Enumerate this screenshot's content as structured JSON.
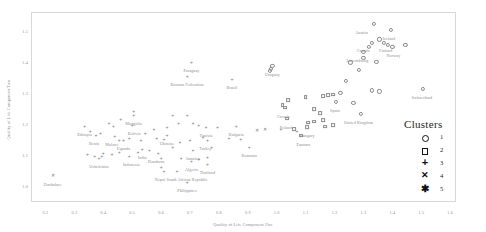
{
  "chart_data": {
    "type": "scatter",
    "title": "",
    "xlabel": "Quality of Life Component One",
    "ylabel": "Quality of Life Component Two",
    "xlim": [
      0.15,
      1.62
    ],
    "ylim": [
      0.95,
      1.56
    ],
    "xticks": [
      "0.2",
      "0.3",
      "0.4",
      "0.5",
      "0.6",
      "0.7",
      "0.8",
      "0.9",
      "1.0",
      "1.1",
      "1.2",
      "1.3",
      "1.4",
      "1.5",
      "1.6"
    ],
    "xtick_values": [
      0.2,
      0.3,
      0.4,
      0.5,
      0.6,
      0.7,
      0.8,
      0.9,
      1.0,
      1.1,
      1.2,
      1.3,
      1.4,
      1.5,
      1.6
    ],
    "yticks": [
      "1.5",
      "1.4",
      "1.3",
      "1.2",
      "1.1",
      "1.0"
    ],
    "ytick_values": [
      1.5,
      1.4,
      1.3,
      1.2,
      1.1,
      1.0
    ],
    "grid": false,
    "legend_position": "lower-right",
    "legend_title": "Clusters",
    "legend_entries": [
      {
        "label": "1",
        "marker": "circle"
      },
      {
        "label": "2",
        "marker": "square"
      },
      {
        "label": "3",
        "marker": "plus"
      },
      {
        "label": "4",
        "marker": "x"
      },
      {
        "label": "5",
        "marker": "asterisk"
      }
    ],
    "series": [
      {
        "name": "1",
        "marker": "circle"
      },
      {
        "name": "2",
        "marker": "square"
      },
      {
        "name": "3",
        "marker": "plus"
      },
      {
        "name": "4",
        "marker": "x"
      },
      {
        "name": "5",
        "marker": "asterisk"
      }
    ],
    "points": [
      {
        "label": "Austria",
        "x": 1.335,
        "y": 1.523,
        "cluster": 1,
        "lab_dx": -12,
        "lab_dy": 6
      },
      {
        "label": "Iceland",
        "x": 1.395,
        "y": 1.503,
        "cluster": 1,
        "lab_dx": -2,
        "lab_dy": 6
      },
      {
        "label": "Canada",
        "x": 1.33,
        "y": 1.462,
        "cluster": 1,
        "lab_dx": -9,
        "lab_dy": 5
      },
      {
        "label": "Finland",
        "x": 1.37,
        "y": 1.462,
        "cluster": 1,
        "lab_dx": 2,
        "lab_dy": 5
      },
      {
        "label": "Norway",
        "x": 1.4,
        "y": 1.448,
        "cluster": 1,
        "lab_dx": 1,
        "lab_dy": 6
      },
      {
        "label": "Luxembourg",
        "x": 1.3,
        "y": 1.432,
        "cluster": 1,
        "lab_dx": -6,
        "lab_dy": 6
      },
      {
        "label": "Switzerland",
        "x": 1.505,
        "y": 1.313,
        "cluster": 1,
        "lab_dx": -1,
        "lab_dy": 6
      },
      {
        "label": "Spain",
        "x": 1.205,
        "y": 1.272,
        "cluster": 1,
        "lab_dx": -1,
        "lab_dy": 6
      },
      {
        "label": "United Kingdom",
        "x": 1.29,
        "y": 1.233,
        "cluster": 1,
        "lab_dx": -2,
        "lab_dy": 6
      },
      {
        "label": "Uruguay",
        "x": 0.985,
        "y": 1.387,
        "cluster": 1,
        "lab_dx": 0,
        "lab_dy": 6
      },
      {
        "label": "Croatia",
        "x": 1.03,
        "y": 1.253,
        "cluster": 2,
        "lab_dx": -2,
        "lab_dy": 6
      },
      {
        "label": "Poland",
        "x": 1.035,
        "y": 1.218,
        "cluster": 2,
        "lab_dx": -1,
        "lab_dy": 6
      },
      {
        "label": "Hungary",
        "x": 1.105,
        "y": 1.19,
        "cluster": 2,
        "lab_dx": 0,
        "lab_dy": 6
      },
      {
        "label": "Panama",
        "x": 1.085,
        "y": 1.163,
        "cluster": 2,
        "lab_dx": 2,
        "lab_dy": 6
      },
      {
        "label": "Paraguay",
        "x": 0.705,
        "y": 1.4,
        "cluster": 3,
        "lab_dx": 0,
        "lab_dy": 6
      },
      {
        "label": "Russian Federation",
        "x": 0.69,
        "y": 1.355,
        "cluster": 3,
        "lab_dx": 0,
        "lab_dy": 6
      },
      {
        "label": "Brazil",
        "x": 0.845,
        "y": 1.345,
        "cluster": 3,
        "lab_dx": 0,
        "lab_dy": 6
      },
      {
        "label": "Mongolia",
        "x": 0.505,
        "y": 1.228,
        "cluster": 3,
        "lab_dx": 0,
        "lab_dy": 6
      },
      {
        "label": "Bolivia",
        "x": 0.5,
        "y": 1.198,
        "cluster": 3,
        "lab_dx": 2,
        "lab_dy": 6
      },
      {
        "label": "Ethiopia",
        "x": 0.335,
        "y": 1.193,
        "cluster": 3,
        "lab_dx": 0,
        "lab_dy": 6
      },
      {
        "label": "Benin",
        "x": 0.375,
        "y": 1.165,
        "cluster": 3,
        "lab_dx": -2,
        "lab_dy": 6
      },
      {
        "label": "Malawi",
        "x": 0.44,
        "y": 1.162,
        "cluster": 3,
        "lab_dx": -3,
        "lab_dy": 6
      },
      {
        "label": "Uganda",
        "x": 0.47,
        "y": 1.15,
        "cluster": 3,
        "lab_dx": 0,
        "lab_dy": 6
      },
      {
        "label": "Ukraine",
        "x": 0.62,
        "y": 1.165,
        "cluster": 3,
        "lab_dx": 0,
        "lab_dy": 6
      },
      {
        "label": "Tunisia",
        "x": 0.755,
        "y": 1.192,
        "cluster": 3,
        "lab_dx": 0,
        "lab_dy": 6
      },
      {
        "label": "Bulgaria",
        "x": 0.86,
        "y": 1.195,
        "cluster": 3,
        "lab_dx": 0,
        "lab_dy": 6
      },
      {
        "label": "Turkey",
        "x": 0.76,
        "y": 1.15,
        "cluster": 3,
        "lab_dx": -2,
        "lab_dy": 6
      },
      {
        "label": "Romania",
        "x": 0.905,
        "y": 1.128,
        "cluster": 3,
        "lab_dx": 0,
        "lab_dy": 6
      },
      {
        "label": "India",
        "x": 0.535,
        "y": 1.12,
        "cluster": 3,
        "lab_dx": 0,
        "lab_dy": 6
      },
      {
        "label": "Honduras",
        "x": 0.59,
        "y": 1.108,
        "cluster": 3,
        "lab_dx": -2,
        "lab_dy": 6
      },
      {
        "label": "Indonesia",
        "x": 0.49,
        "y": 1.098,
        "cluster": 3,
        "lab_dx": 2,
        "lab_dy": 6
      },
      {
        "label": "Uzbekistan",
        "x": 0.385,
        "y": 1.092,
        "cluster": 3,
        "lab_dx": 0,
        "lab_dy": 6
      },
      {
        "label": "Jamaica",
        "x": 0.71,
        "y": 1.118,
        "cluster": 3,
        "lab_dx": 0,
        "lab_dy": 6
      },
      {
        "label": "Algeria",
        "x": 0.705,
        "y": 1.083,
        "cluster": 3,
        "lab_dx": 0,
        "lab_dy": 6
      },
      {
        "label": "Thailand",
        "x": 0.76,
        "y": 1.073,
        "cluster": 3,
        "lab_dx": 0,
        "lab_dy": 6
      },
      {
        "label": "Nepal",
        "x": 0.61,
        "y": 1.048,
        "cluster": 3,
        "lab_dx": -4,
        "lab_dy": 6
      },
      {
        "label": "South African Republic",
        "x": 0.655,
        "y": 1.048,
        "cluster": 3,
        "lab_dx": 10,
        "lab_dy": 6
      },
      {
        "label": "Philippines",
        "x": 0.69,
        "y": 1.013,
        "cluster": 3,
        "lab_dx": 0,
        "lab_dy": 6
      },
      {
        "label": "Zimbabwe",
        "x": 0.225,
        "y": 1.035,
        "cluster": 4,
        "lab_dx": 0,
        "lab_dy": 6
      }
    ],
    "unlabeled_points": [
      {
        "x": 1.355,
        "y": 1.472,
        "cluster": 1
      },
      {
        "x": 1.385,
        "y": 1.455,
        "cluster": 1
      },
      {
        "x": 1.445,
        "y": 1.455,
        "cluster": 1
      },
      {
        "x": 1.32,
        "y": 1.448,
        "cluster": 1
      },
      {
        "x": 1.3,
        "y": 1.412,
        "cluster": 1
      },
      {
        "x": 1.345,
        "y": 1.4,
        "cluster": 1
      },
      {
        "x": 1.255,
        "y": 1.398,
        "cluster": 1
      },
      {
        "x": 1.285,
        "y": 1.375,
        "cluster": 1
      },
      {
        "x": 1.24,
        "y": 1.338,
        "cluster": 1
      },
      {
        "x": 1.33,
        "y": 1.308,
        "cluster": 1
      },
      {
        "x": 1.355,
        "y": 1.305,
        "cluster": 1
      },
      {
        "x": 1.22,
        "y": 1.3,
        "cluster": 1
      },
      {
        "x": 1.195,
        "y": 1.295,
        "cluster": 2
      },
      {
        "x": 1.178,
        "y": 1.293,
        "cluster": 2
      },
      {
        "x": 1.16,
        "y": 1.29,
        "cluster": 2
      },
      {
        "x": 1.1,
        "y": 1.288,
        "cluster": 2
      },
      {
        "x": 1.265,
        "y": 1.268,
        "cluster": 1
      },
      {
        "x": 1.04,
        "y": 1.277,
        "cluster": 2
      },
      {
        "x": 0.975,
        "y": 1.372,
        "cluster": 1
      },
      {
        "x": 0.98,
        "y": 1.378,
        "cluster": 1
      },
      {
        "x": 1.02,
        "y": 1.262,
        "cluster": 2
      },
      {
        "x": 1.128,
        "y": 1.248,
        "cluster": 2
      },
      {
        "x": 1.15,
        "y": 1.235,
        "cluster": 2
      },
      {
        "x": 1.16,
        "y": 1.213,
        "cluster": 2
      },
      {
        "x": 1.128,
        "y": 1.208,
        "cluster": 2
      },
      {
        "x": 1.108,
        "y": 1.205,
        "cluster": 2
      },
      {
        "x": 1.195,
        "y": 1.198,
        "cluster": 2
      },
      {
        "x": 1.168,
        "y": 1.192,
        "cluster": 2
      },
      {
        "x": 1.06,
        "y": 1.185,
        "cluster": 2
      },
      {
        "x": 1.07,
        "y": 1.178,
        "cluster": 3
      },
      {
        "x": 1.015,
        "y": 1.183,
        "cluster": 3
      },
      {
        "x": 0.795,
        "y": 1.192,
        "cluster": 3
      },
      {
        "x": 0.73,
        "y": 1.198,
        "cluster": 3
      },
      {
        "x": 0.64,
        "y": 1.23,
        "cluster": 3
      },
      {
        "x": 0.69,
        "y": 1.228,
        "cluster": 3
      },
      {
        "x": 0.66,
        "y": 1.205,
        "cluster": 3
      },
      {
        "x": 0.71,
        "y": 1.205,
        "cluster": 3
      },
      {
        "x": 0.62,
        "y": 1.19,
        "cluster": 3
      },
      {
        "x": 0.575,
        "y": 1.183,
        "cluster": 3
      },
      {
        "x": 0.545,
        "y": 1.172,
        "cluster": 3
      },
      {
        "x": 0.505,
        "y": 1.242,
        "cluster": 3
      },
      {
        "x": 0.46,
        "y": 1.218,
        "cluster": 3
      },
      {
        "x": 0.42,
        "y": 1.205,
        "cluster": 3
      },
      {
        "x": 0.435,
        "y": 1.195,
        "cluster": 3
      },
      {
        "x": 0.355,
        "y": 1.178,
        "cluster": 3
      },
      {
        "x": 0.39,
        "y": 1.172,
        "cluster": 3
      },
      {
        "x": 0.455,
        "y": 1.15,
        "cluster": 3
      },
      {
        "x": 0.49,
        "y": 1.155,
        "cluster": 3
      },
      {
        "x": 0.53,
        "y": 1.148,
        "cluster": 3
      },
      {
        "x": 0.585,
        "y": 1.155,
        "cluster": 3
      },
      {
        "x": 0.61,
        "y": 1.152,
        "cluster": 3
      },
      {
        "x": 0.665,
        "y": 1.142,
        "cluster": 3
      },
      {
        "x": 0.7,
        "y": 1.15,
        "cluster": 3
      },
      {
        "x": 0.745,
        "y": 1.16,
        "cluster": 3
      },
      {
        "x": 0.835,
        "y": 1.155,
        "cluster": 3
      },
      {
        "x": 0.875,
        "y": 1.152,
        "cluster": 3
      },
      {
        "x": 0.93,
        "y": 1.178,
        "cluster": 4
      },
      {
        "x": 0.96,
        "y": 1.18,
        "cluster": 4
      },
      {
        "x": 0.775,
        "y": 1.128,
        "cluster": 3
      },
      {
        "x": 0.64,
        "y": 1.125,
        "cluster": 3
      },
      {
        "x": 0.56,
        "y": 1.118,
        "cluster": 3
      },
      {
        "x": 0.52,
        "y": 1.112,
        "cluster": 3
      },
      {
        "x": 0.455,
        "y": 1.11,
        "cluster": 3
      },
      {
        "x": 0.43,
        "y": 1.105,
        "cluster": 3
      },
      {
        "x": 0.4,
        "y": 1.108,
        "cluster": 3
      },
      {
        "x": 0.345,
        "y": 1.105,
        "cluster": 3
      },
      {
        "x": 0.37,
        "y": 1.098,
        "cluster": 3
      },
      {
        "x": 0.395,
        "y": 1.098,
        "cluster": 3
      },
      {
        "x": 0.6,
        "y": 1.09,
        "cluster": 3
      },
      {
        "x": 0.67,
        "y": 1.092,
        "cluster": 3
      },
      {
        "x": 0.73,
        "y": 1.088,
        "cluster": 3
      },
      {
        "x": 0.76,
        "y": 1.095,
        "cluster": 3
      },
      {
        "x": 0.6,
        "y": 1.062,
        "cluster": 3
      }
    ]
  }
}
